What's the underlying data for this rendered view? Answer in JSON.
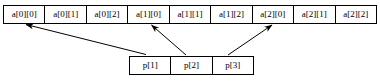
{
  "diagram": {
    "background_color": "#ffffff",
    "line_color": "#000000",
    "arrays": {
      "a": {
        "name": "a",
        "cells": [
          "a[0][0]",
          "a[0][1]",
          "a[0][2]",
          "a[1][0]",
          "a[1][1]",
          "a[1][2]",
          "a[2][0]",
          "a[2][1]",
          "a[2][2]"
        ]
      },
      "p": {
        "name": "p",
        "cells": [
          "p[1]",
          "p[2]",
          "p[3]"
        ]
      }
    },
    "arrows": [
      {
        "name": "arrow-p1-to-a00",
        "from_cell": "p[1]",
        "to_cell": "a[0][0]"
      },
      {
        "name": "arrow-p2-to-a10",
        "from_cell": "p[2]",
        "to_cell": "a[1][0]"
      },
      {
        "name": "arrow-p3-to-a20",
        "from_cell": "p[3]",
        "to_cell": "a[2][0]"
      }
    ]
  }
}
